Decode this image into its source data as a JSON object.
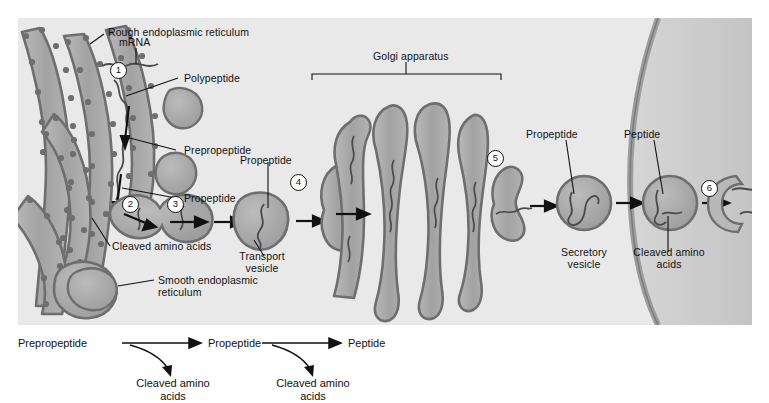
{
  "figure": {
    "type": "biology-diagram"
  },
  "cell_panel": {
    "organelles": {
      "rough_er": "Rough endoplasmic reticulum",
      "smooth_er": "Smooth endoplasmic reticulum",
      "golgi": "Golgi apparatus"
    },
    "labels": {
      "mrna": "mRNA",
      "polypeptide": "Polypeptide",
      "prepropeptide": "Prepropeptide",
      "propeptide_er": "Propeptide",
      "cleaved_amino_acids_er": "Cleaved amino acids",
      "propeptide_transport": "Propeptide",
      "transport_vesicle": "Transport vesicle",
      "propeptide_secretory": "Propeptide",
      "secretory_vesicle": "Secretory vesicle",
      "peptide": "Peptide",
      "cleaved_amino_acids_vesicle": "Cleaved amino acids"
    },
    "steps": [
      {
        "id": "1",
        "marker": "1"
      },
      {
        "id": "2",
        "marker": "2"
      },
      {
        "id": "3",
        "marker": "3"
      },
      {
        "id": "4",
        "marker": "4"
      },
      {
        "id": "5",
        "marker": "5"
      },
      {
        "id": "6",
        "marker": "6"
      }
    ],
    "colors": {
      "background": "#e9e9e9",
      "membrane_stroke": "#6e6e6e",
      "organelle_fill": "#a8a8a8",
      "lumen_fill": "#c2c2c2",
      "cell_exterior": "#cfcfcf",
      "text": "#111111"
    }
  },
  "summary_pathway": {
    "nodes": [
      "Prepropeptide",
      "Propeptide",
      "Peptide"
    ],
    "byproducts": [
      "Cleaved amino acids",
      "Cleaved amino acids"
    ]
  }
}
